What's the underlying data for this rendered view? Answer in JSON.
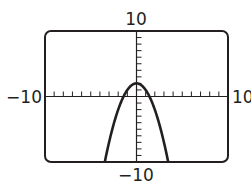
{
  "chart_data": {
    "type": "line",
    "title": "",
    "function": "y = -x^2 + 2",
    "series": [
      {
        "name": "parabola",
        "expression": "-x^2 + 2",
        "vertex": [
          0,
          2
        ],
        "x_intercepts": [
          -1.41,
          1.41
        ],
        "x_range_visible": [
          -3.46,
          3.46
        ]
      }
    ],
    "xlim": [
      -10,
      10
    ],
    "ylim": [
      -10,
      10
    ],
    "xscale": 1,
    "yscale": 1,
    "xlabel": "",
    "ylabel": "",
    "tick_labels": {
      "xmin": "−10",
      "xmax": "10",
      "ymin": "−10",
      "ymax": "10"
    },
    "grid": false,
    "legend": null
  },
  "labels": {
    "top": "10",
    "bottom": "−10",
    "left": "−10",
    "right": "10"
  },
  "colors": {
    "ink": "#231f20",
    "background": "#ffffff"
  }
}
